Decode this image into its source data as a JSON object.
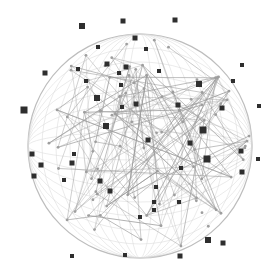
{
  "image": {
    "description": "Network sphere illustration with connected nodes",
    "width": 279,
    "height": 276,
    "background": "#ffffff",
    "line_color": "#9a9a9a",
    "node_color": "#2e2e2e",
    "sphere": {
      "cx": 140,
      "cy": 146,
      "r": 112
    },
    "nodes": [
      [
        82,
        26,
        6
      ],
      [
        123,
        21,
        5
      ],
      [
        175,
        20,
        5
      ],
      [
        135,
        38,
        5
      ],
      [
        146,
        49,
        4
      ],
      [
        98,
        47,
        4
      ],
      [
        107,
        64,
        5
      ],
      [
        126,
        67,
        5
      ],
      [
        119,
        73,
        4
      ],
      [
        78,
        69,
        4
      ],
      [
        45,
        73,
        5
      ],
      [
        86,
        81,
        4
      ],
      [
        121,
        85,
        4
      ],
      [
        97,
        98,
        6
      ],
      [
        136,
        104,
        5
      ],
      [
        106,
        126,
        6
      ],
      [
        122,
        107,
        4
      ],
      [
        199,
        84,
        6
      ],
      [
        242,
        65,
        4
      ],
      [
        233,
        81,
        4
      ],
      [
        159,
        71,
        4
      ],
      [
        178,
        105,
        5
      ],
      [
        222,
        108,
        5
      ],
      [
        259,
        106,
        4
      ],
      [
        203,
        130,
        7
      ],
      [
        24,
        110,
        7
      ],
      [
        32,
        154,
        5
      ],
      [
        41,
        165,
        5
      ],
      [
        34,
        176,
        5
      ],
      [
        100,
        181,
        5
      ],
      [
        110,
        191,
        5
      ],
      [
        72,
        163,
        5
      ],
      [
        74,
        154,
        4
      ],
      [
        64,
        180,
        4
      ],
      [
        148,
        140,
        5
      ],
      [
        190,
        143,
        5
      ],
      [
        207,
        159,
        7
      ],
      [
        241,
        151,
        5
      ],
      [
        258,
        159,
        4
      ],
      [
        242,
        172,
        5
      ],
      [
        156,
        187,
        4
      ],
      [
        181,
        168,
        4
      ],
      [
        154,
        202,
        4
      ],
      [
        154,
        210,
        4
      ],
      [
        179,
        202,
        4
      ],
      [
        140,
        217,
        4
      ],
      [
        208,
        240,
        6
      ],
      [
        223,
        243,
        5
      ],
      [
        180,
        256,
        5
      ],
      [
        125,
        255,
        4
      ],
      [
        72,
        256,
        4
      ]
    ]
  }
}
